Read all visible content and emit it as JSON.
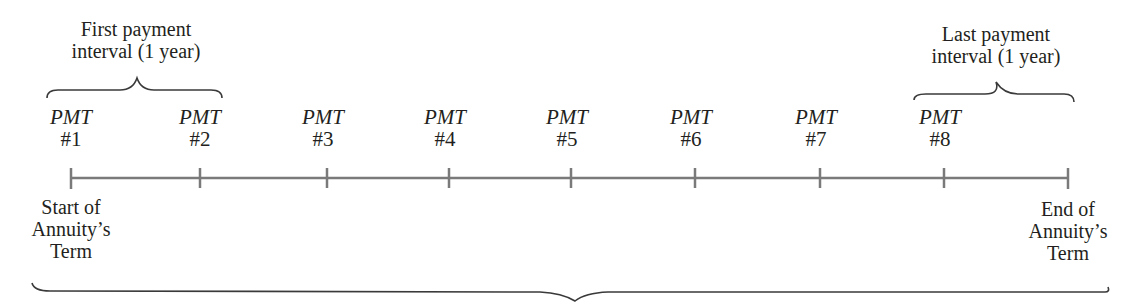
{
  "diagram": {
    "type": "timeline",
    "colors": {
      "timeline": "#7a7a7a",
      "text": "#231f20",
      "brace": "#3a3a3a"
    },
    "first_interval": {
      "line1": "First payment",
      "line2": "interval (1 year)"
    },
    "last_interval": {
      "line1": "Last payment",
      "line2": "interval (1 year)"
    },
    "payments": [
      {
        "word": "PMT",
        "num": "#1"
      },
      {
        "word": "PMT",
        "num": "#2"
      },
      {
        "word": "PMT",
        "num": "#3"
      },
      {
        "word": "PMT",
        "num": "#4"
      },
      {
        "word": "PMT",
        "num": "#5"
      },
      {
        "word": "PMT",
        "num": "#6"
      },
      {
        "word": "PMT",
        "num": "#7"
      },
      {
        "word": "PMT",
        "num": "#8"
      }
    ],
    "start_label": {
      "line1": "Start of",
      "line2": "Annuity’s",
      "line3": "Term"
    },
    "end_label": {
      "line1": "End of",
      "line2": "Annuity’s",
      "line3": "Term"
    },
    "tick_count": 9
  }
}
